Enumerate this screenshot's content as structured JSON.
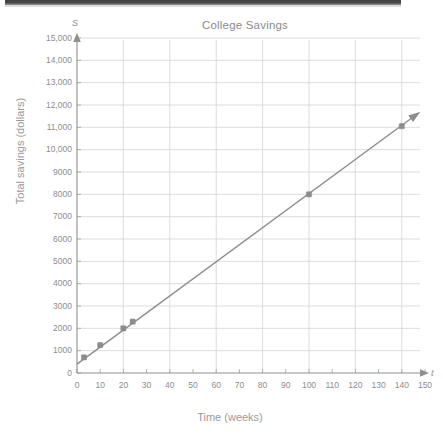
{
  "chart_data": {
    "type": "scatter",
    "title": "College Savings",
    "xlabel": "Time (weeks)",
    "ylabel": "Total savings (dollars)",
    "x_axis_variable": "t",
    "y_axis_variable": "S",
    "xlim": [
      0,
      150
    ],
    "ylim": [
      0,
      15000
    ],
    "x_tick_step": 10,
    "y_tick_step": 1000,
    "grid": true,
    "x_gridline_step": 20,
    "y_gridline_step": 1000,
    "legend": "none",
    "series": [
      {
        "name": "Total savings",
        "marker": "square",
        "color": "#8c8c8c",
        "points": [
          {
            "x": 3,
            "y": 700
          },
          {
            "x": 10,
            "y": 1250
          },
          {
            "x": 20,
            "y": 2000
          },
          {
            "x": 24,
            "y": 2300
          },
          {
            "x": 100,
            "y": 8000
          },
          {
            "x": 140,
            "y": 11050
          }
        ]
      }
    ],
    "trend_line": {
      "name": "line of best fit",
      "color": "#8c8c8c",
      "arrow_end": true,
      "from": {
        "x": 0,
        "y": 400
      },
      "to": {
        "x": 148,
        "y": 11700
      }
    },
    "x_tick_labels": [
      "0",
      "10",
      "20",
      "30",
      "40",
      "50",
      "60",
      "70",
      "80",
      "90",
      "100",
      "110",
      "120",
      "130",
      "140",
      "150"
    ],
    "y_tick_labels": [
      "0",
      "1000",
      "2000",
      "3000",
      "4000",
      "5000",
      "6000",
      "7000",
      "8000",
      "9000",
      "10,000",
      "11,000",
      "12,000",
      "13,000",
      "14,000",
      "15,000"
    ],
    "colors": {
      "line": "#8c8c8c",
      "marker": "#878787",
      "grid": "#d4d4d4",
      "axis": "#8f8f8f",
      "text": "#8d8d8d"
    }
  }
}
